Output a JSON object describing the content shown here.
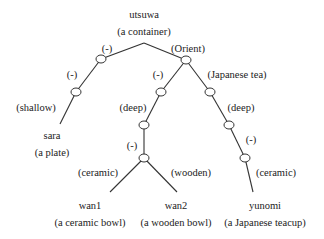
{
  "diagram": {
    "type": "tree",
    "root": {
      "word": "utsuwa",
      "gloss": "(a container)"
    },
    "edge_labels": {
      "root_left": "(-)",
      "root_right": "(Orient)",
      "left_mid": "(-)",
      "left_shallow": "(shallow)",
      "orient_left": "(-)",
      "orient_right": "(Japanese tea)",
      "orient_left_deep": "(deep)",
      "wan_mid": "(-)",
      "wan_ceramic": "(ceramic)",
      "wan_wooden": "(wooden)",
      "yunomi_deep": "(deep)",
      "yunomi_mid": "(-)",
      "yunomi_ceramic": "(ceramic)"
    },
    "leaves": [
      {
        "word": "sara",
        "gloss": "(a plate)"
      },
      {
        "word": "wan1",
        "gloss": "(a ceramic bowl)"
      },
      {
        "word": "wan2",
        "gloss": "(a wooden bowl)"
      },
      {
        "word": "yunomi",
        "gloss": "(a Japanese teacup)"
      }
    ]
  }
}
